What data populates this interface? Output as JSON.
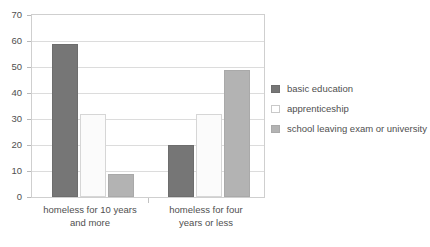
{
  "chart_data": {
    "type": "bar",
    "title": "",
    "subtitle": "",
    "xlabel": "",
    "ylabel": "",
    "ylim": [
      0,
      70
    ],
    "yticks": [
      0,
      10,
      20,
      30,
      40,
      50,
      60,
      70
    ],
    "ytick_labels": [
      "0",
      "10",
      "20",
      "30",
      "40",
      "50",
      "60",
      "70"
    ],
    "grid": true,
    "legend_position": "right",
    "categories": [
      "homeless for 10 years and more",
      "homeless for four years or less"
    ],
    "category_lines": [
      [
        "homeless for 10 years",
        "and more"
      ],
      [
        "homeless for four",
        "years or less"
      ]
    ],
    "series": [
      {
        "name": "basic education",
        "color": "#767676",
        "values": [
          59,
          20
        ]
      },
      {
        "name": "apprenticeship",
        "color": "#fbfbfb",
        "values": [
          32,
          32
        ]
      },
      {
        "name": "school leaving exam or university",
        "color": "#b3b3b3",
        "values": [
          9,
          49
        ]
      }
    ]
  },
  "legend": {
    "items": [
      {
        "label": "basic education",
        "swatch": "legend-swatch-basic-education"
      },
      {
        "label": "apprenticeship",
        "swatch": "legend-swatch-apprenticeship"
      },
      {
        "label": "school leaving exam or university",
        "swatch": "legend-swatch-school-leaving-exam"
      }
    ]
  }
}
